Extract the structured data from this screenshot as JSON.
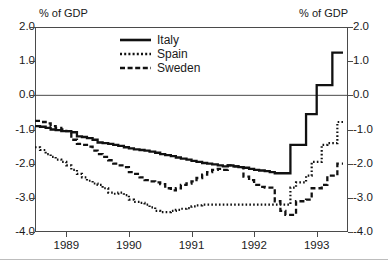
{
  "chart_data": {
    "type": "line",
    "title": "",
    "subtitle": "",
    "xlabel": "",
    "ylabel": "% of GDP",
    "ylabel_right": "% of GDP",
    "ylim": [
      -4.0,
      2.0
    ],
    "xlim": [
      1988.5,
      1993.5
    ],
    "grid": false,
    "zero_line": true,
    "legend_position": "top-center",
    "yticks": [
      "2.0",
      "1.0",
      "0.0",
      "-1.0",
      "-2.0",
      "-3.0",
      "-4.0"
    ],
    "ytick_values": [
      2.0,
      1.0,
      0.0,
      -1.0,
      -2.0,
      -3.0,
      -4.0
    ],
    "yticks_right": [
      "2.0",
      "1.0",
      "0.0",
      "-1.0",
      "-2.0",
      "-3.0",
      "-4.0"
    ],
    "xticks": [
      "1989",
      "1990",
      "1991",
      "1992",
      "1993"
    ],
    "xtick_values": [
      1989,
      1990,
      1991,
      1992,
      1993
    ],
    "series": [
      {
        "name": "Italy",
        "style": "solid",
        "color": "#111111",
        "x": [
          1988.5,
          1988.58,
          1988.67,
          1988.75,
          1988.83,
          1988.92,
          1989.0,
          1989.08,
          1989.17,
          1989.25,
          1989.33,
          1989.42,
          1989.5,
          1989.58,
          1989.67,
          1989.75,
          1989.83,
          1989.92,
          1990.0,
          1990.08,
          1990.17,
          1990.25,
          1990.33,
          1990.42,
          1990.5,
          1990.58,
          1990.67,
          1990.75,
          1990.83,
          1990.92,
          1991.0,
          1991.08,
          1991.17,
          1991.25,
          1991.33,
          1991.42,
          1991.5,
          1991.58,
          1991.67,
          1991.75,
          1991.83,
          1991.92,
          1992.0,
          1992.08,
          1992.17,
          1992.25,
          1992.33,
          1992.42,
          1992.5,
          1992.58,
          1992.67,
          1992.75,
          1992.83,
          1992.92,
          1993.0,
          1993.08,
          1993.17,
          1993.25,
          1993.33,
          1993.42
        ],
        "y": [
          -0.9,
          -0.92,
          -0.95,
          -1.0,
          -1.02,
          -1.05,
          -1.05,
          -1.08,
          -1.2,
          -1.22,
          -1.25,
          -1.3,
          -1.38,
          -1.4,
          -1.42,
          -1.45,
          -1.48,
          -1.52,
          -1.55,
          -1.58,
          -1.6,
          -1.62,
          -1.65,
          -1.68,
          -1.72,
          -1.75,
          -1.78,
          -1.82,
          -1.85,
          -1.88,
          -1.92,
          -1.95,
          -1.98,
          -2.0,
          -2.02,
          -2.05,
          -2.08,
          -2.05,
          -2.08,
          -2.1,
          -2.12,
          -2.15,
          -2.18,
          -2.2,
          -2.22,
          -2.25,
          -2.28,
          -2.28,
          -2.28,
          -1.45,
          -1.45,
          -1.45,
          -0.55,
          -0.55,
          0.3,
          0.3,
          0.3,
          1.25,
          1.25,
          1.25
        ]
      },
      {
        "name": "Spain",
        "style": "dotted",
        "color": "#111111",
        "x": [
          1988.5,
          1988.58,
          1988.67,
          1988.75,
          1988.83,
          1988.92,
          1989.0,
          1989.08,
          1989.17,
          1989.25,
          1989.33,
          1989.42,
          1989.5,
          1989.58,
          1989.67,
          1989.75,
          1989.83,
          1989.92,
          1990.0,
          1990.08,
          1990.17,
          1990.25,
          1990.33,
          1990.42,
          1990.5,
          1990.58,
          1990.67,
          1990.75,
          1990.83,
          1990.92,
          1991.0,
          1991.08,
          1991.17,
          1991.25,
          1991.33,
          1991.42,
          1991.5,
          1991.58,
          1991.67,
          1991.75,
          1991.83,
          1991.92,
          1992.0,
          1992.08,
          1992.17,
          1992.25,
          1992.33,
          1992.42,
          1992.5,
          1992.58,
          1992.67,
          1992.75,
          1992.83,
          1992.92,
          1993.0,
          1993.08,
          1993.17,
          1993.25,
          1993.33,
          1993.42
        ],
        "y": [
          -1.52,
          -1.6,
          -1.72,
          -1.8,
          -1.88,
          -1.95,
          -2.05,
          -2.18,
          -2.3,
          -2.4,
          -2.5,
          -2.58,
          -2.62,
          -2.72,
          -2.85,
          -2.88,
          -2.85,
          -2.92,
          -3.05,
          -3.12,
          -3.15,
          -3.2,
          -3.28,
          -3.38,
          -3.42,
          -3.42,
          -3.38,
          -3.35,
          -3.32,
          -3.3,
          -3.25,
          -3.22,
          -3.2,
          -3.2,
          -3.2,
          -3.2,
          -3.2,
          -3.2,
          -3.2,
          -3.2,
          -3.2,
          -3.2,
          -3.2,
          -3.2,
          -3.2,
          -3.2,
          -3.2,
          -3.2,
          -3.2,
          -2.7,
          -2.55,
          -2.55,
          -2.35,
          -1.95,
          -1.95,
          -1.45,
          -1.4,
          -1.4,
          -0.78,
          -0.78
        ]
      },
      {
        "name": "Sweden",
        "style": "dashed",
        "color": "#111111",
        "x": [
          1988.5,
          1988.58,
          1988.67,
          1988.75,
          1988.83,
          1988.92,
          1989.0,
          1989.08,
          1989.17,
          1989.25,
          1989.33,
          1989.42,
          1989.5,
          1989.58,
          1989.67,
          1989.75,
          1989.83,
          1989.92,
          1990.0,
          1990.08,
          1990.17,
          1990.25,
          1990.33,
          1990.42,
          1990.5,
          1990.58,
          1990.67,
          1990.75,
          1990.83,
          1990.92,
          1991.0,
          1991.08,
          1991.17,
          1991.25,
          1991.33,
          1991.42,
          1991.5,
          1991.58,
          1991.67,
          1991.75,
          1991.83,
          1991.92,
          1992.0,
          1992.08,
          1992.17,
          1992.25,
          1992.33,
          1992.42,
          1992.5,
          1992.58,
          1992.67,
          1992.75,
          1992.83,
          1992.92,
          1993.0,
          1993.08,
          1993.17,
          1993.25,
          1993.33,
          1993.42
        ],
        "y": [
          -0.75,
          -0.78,
          -0.82,
          -0.9,
          -0.95,
          -1.0,
          -1.05,
          -1.3,
          -1.42,
          -1.45,
          -1.5,
          -1.62,
          -1.72,
          -1.8,
          -1.9,
          -2.0,
          -2.05,
          -2.1,
          -2.25,
          -2.3,
          -2.4,
          -2.48,
          -2.52,
          -2.55,
          -2.6,
          -2.72,
          -2.78,
          -2.72,
          -2.62,
          -2.58,
          -2.52,
          -2.42,
          -2.32,
          -2.25,
          -2.18,
          -2.15,
          -2.18,
          -2.05,
          -2.08,
          -2.1,
          -2.38,
          -2.48,
          -2.62,
          -2.68,
          -2.7,
          -2.7,
          -3.1,
          -3.38,
          -3.5,
          -3.5,
          -3.1,
          -3.1,
          -3.05,
          -2.72,
          -2.72,
          -2.62,
          -2.35,
          -2.35,
          -2.0,
          -2.0
        ]
      }
    ]
  },
  "axes": {
    "left_unit": "% of GDP",
    "right_unit": "% of GDP"
  },
  "legend": {
    "items": [
      {
        "label": "Italy",
        "style": "solid"
      },
      {
        "label": "Spain",
        "style": "dotted"
      },
      {
        "label": "Sweden",
        "style": "dashed"
      }
    ]
  },
  "footer": {
    "caption_fragment": ""
  }
}
